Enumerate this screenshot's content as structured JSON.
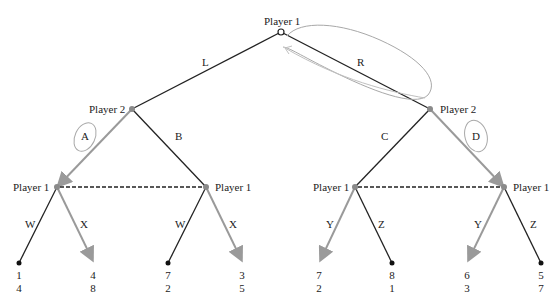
{
  "diagram": {
    "type": "extensive-form game tree",
    "colors": {
      "edge": "#222222",
      "highlight_edge": "#9a9a9a",
      "annotation": "#a8a8a8",
      "node": "#8a8a8a"
    },
    "root": {
      "label": "Player 1",
      "x": 281,
      "y": 32
    },
    "level1": [
      {
        "label": "Player 2",
        "x": 132,
        "y": 109,
        "action_in": "L"
      },
      {
        "label": "Player 2",
        "x": 430,
        "y": 109,
        "action_in": "R"
      }
    ],
    "level2": [
      {
        "label": "Player 1",
        "x": 57,
        "y": 187,
        "action_in": "A"
      },
      {
        "label": "Player 1",
        "x": 206,
        "y": 187,
        "action_in": "B"
      },
      {
        "label": "Player 1",
        "x": 355,
        "y": 187,
        "action_in": "C"
      },
      {
        "label": "Player 1",
        "x": 504,
        "y": 187,
        "action_in": "D"
      }
    ],
    "leaves": [
      {
        "action": "W",
        "p1": "1",
        "p2": "4",
        "x": 19
      },
      {
        "action": "X",
        "p1": "4",
        "p2": "8",
        "x": 93
      },
      {
        "action": "W",
        "p1": "7",
        "p2": "2",
        "x": 168
      },
      {
        "action": "X",
        "p1": "3",
        "p2": "5",
        "x": 242
      },
      {
        "action": "Y",
        "p1": "7",
        "p2": "2",
        "x": 320
      },
      {
        "action": "Z",
        "p1": "8",
        "p2": "1",
        "x": 392
      },
      {
        "action": "Y",
        "p1": "6",
        "p2": "3",
        "x": 468
      },
      {
        "action": "Z",
        "p1": "5",
        "p2": "7",
        "x": 541
      }
    ],
    "actions": {
      "L": "L",
      "R": "R",
      "A": "A",
      "B": "B",
      "C": "C",
      "D": "D"
    },
    "information_sets": [
      "Player 1 (after A / B)",
      "Player 1 (after C / D)"
    ],
    "highlighted_choices": [
      "A",
      "D",
      "X",
      "X",
      "Y",
      "Y"
    ],
    "circled": [
      "A",
      "D",
      "R"
    ]
  }
}
